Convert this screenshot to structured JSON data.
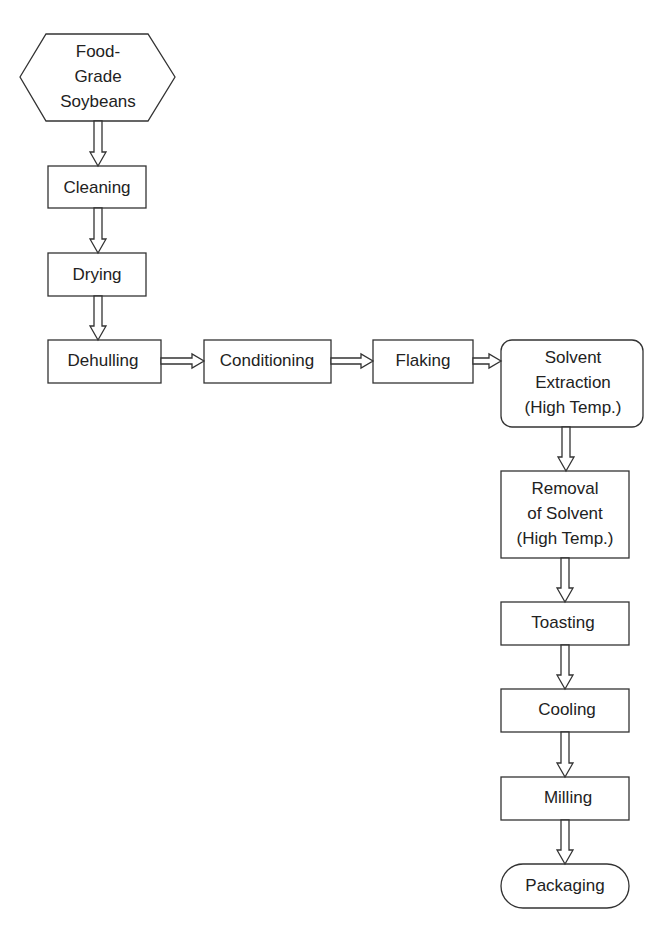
{
  "diagram": {
    "colors": {
      "stroke": "#333333",
      "text": "#222222",
      "background": "#ffffff"
    },
    "nodes": [
      {
        "id": "food-grade-soybeans",
        "shape": "hexagon",
        "lines": [
          "Food-",
          "Grade",
          "Soybeans"
        ]
      },
      {
        "id": "cleaning",
        "shape": "rect",
        "lines": [
          "Cleaning"
        ]
      },
      {
        "id": "drying",
        "shape": "rect",
        "lines": [
          "Drying"
        ]
      },
      {
        "id": "dehulling",
        "shape": "rect",
        "lines": [
          "Dehulling"
        ]
      },
      {
        "id": "conditioning",
        "shape": "rect",
        "lines": [
          "Conditioning"
        ]
      },
      {
        "id": "flaking",
        "shape": "rect",
        "lines": [
          "Flaking"
        ]
      },
      {
        "id": "solvent-extraction",
        "shape": "rounded-rect",
        "lines": [
          "Solvent",
          "Extraction",
          "(High Temp.)"
        ]
      },
      {
        "id": "removal-of-solvent",
        "shape": "rect",
        "lines": [
          "Removal",
          "of Solvent",
          "(High Temp.)"
        ]
      },
      {
        "id": "toasting",
        "shape": "rect",
        "lines": [
          "Toasting"
        ]
      },
      {
        "id": "cooling",
        "shape": "rect",
        "lines": [
          "Cooling"
        ]
      },
      {
        "id": "milling",
        "shape": "rect",
        "lines": [
          "Milling"
        ]
      },
      {
        "id": "packaging",
        "shape": "terminal",
        "lines": [
          "Packaging"
        ]
      }
    ],
    "edges": [
      {
        "from": "food-grade-soybeans",
        "to": "cleaning",
        "style": "hollow-arrow"
      },
      {
        "from": "cleaning",
        "to": "drying",
        "style": "hollow-arrow"
      },
      {
        "from": "drying",
        "to": "dehulling",
        "style": "hollow-arrow"
      },
      {
        "from": "dehulling",
        "to": "conditioning",
        "style": "hollow-arrow"
      },
      {
        "from": "conditioning",
        "to": "flaking",
        "style": "hollow-arrow"
      },
      {
        "from": "flaking",
        "to": "solvent-extraction",
        "style": "hollow-arrow"
      },
      {
        "from": "solvent-extraction",
        "to": "removal-of-solvent",
        "style": "hollow-arrow"
      },
      {
        "from": "removal-of-solvent",
        "to": "toasting",
        "style": "hollow-arrow"
      },
      {
        "from": "toasting",
        "to": "cooling",
        "style": "hollow-arrow"
      },
      {
        "from": "cooling",
        "to": "milling",
        "style": "hollow-arrow"
      },
      {
        "from": "milling",
        "to": "packaging",
        "style": "hollow-arrow"
      }
    ]
  }
}
